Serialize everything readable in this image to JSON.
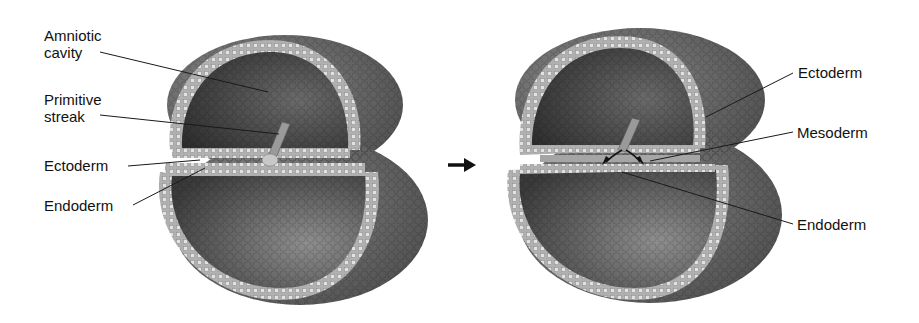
{
  "figure": {
    "panels": [
      {
        "id": "left",
        "description": "Bilaminar embryonic disc with primitive streak",
        "labels": [
          {
            "text": "Amniotic cavity",
            "line1": "Amniotic",
            "line2": "cavity"
          },
          {
            "text": "Primitive streak",
            "line1": "Primitive",
            "line2": "streak"
          },
          {
            "text": "Ectoderm"
          },
          {
            "text": "Endoderm"
          }
        ]
      },
      {
        "id": "right",
        "description": "Trilaminar embryonic disc after gastrulation",
        "labels": [
          {
            "text": "Ectoderm"
          },
          {
            "text": "Mesoderm"
          },
          {
            "text": "Endoderm"
          }
        ]
      }
    ],
    "transition_arrow": "right-arrow-icon",
    "colors": {
      "background": "#ffffff",
      "outer_surface": "#6e6e6e",
      "cavity_dark": "#3c3c3c",
      "cell_layer": "#b4b4b4",
      "cell_dots": "#e6e6e6",
      "text": "#111111",
      "leader_lines": "#1a1a1a"
    }
  }
}
